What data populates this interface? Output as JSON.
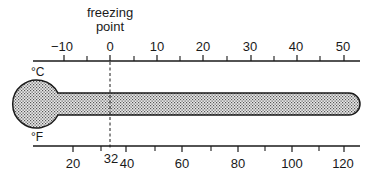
{
  "diagram": {
    "annotation": {
      "line1": "freezing",
      "line2": "point"
    },
    "celsius": {
      "unit_label": "°C",
      "tick_labels": [
        "−10",
        "0",
        "10",
        "20",
        "30",
        "40",
        "50"
      ],
      "tick_values": [
        -10,
        0,
        10,
        20,
        30,
        40,
        50
      ],
      "minor_tick_values": [
        -5,
        5,
        15,
        25,
        35,
        45
      ]
    },
    "fahrenheit": {
      "unit_label": "°F",
      "tick_labels": [
        "20",
        "32",
        "40",
        "60",
        "80",
        "100",
        "120"
      ],
      "tick_values": [
        20,
        32,
        40,
        60,
        80,
        100,
        120
      ],
      "minor_tick_values": [
        30,
        50,
        70,
        90,
        110
      ]
    },
    "colors": {
      "ink": "#1a1a1a",
      "fill_dots": "#555555",
      "background": "#ffffff"
    }
  }
}
